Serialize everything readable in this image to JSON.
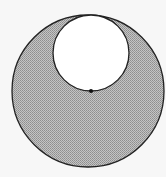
{
  "diagram": {
    "type": "geometry",
    "background_color": "#f7f7f7",
    "outer_circle": {
      "cx": 88,
      "cy": 91,
      "r": 76,
      "fill": "#b8b8b8",
      "stroke": "#222222",
      "shaded": true
    },
    "inner_circle": {
      "cx": 91,
      "cy": 53,
      "r": 38,
      "fill": "#ffffff",
      "stroke": "#222222",
      "shaded": false
    },
    "center_point": {
      "cx": 91,
      "cy": 91,
      "r": 2,
      "fill": "#111111",
      "label": ""
    }
  }
}
